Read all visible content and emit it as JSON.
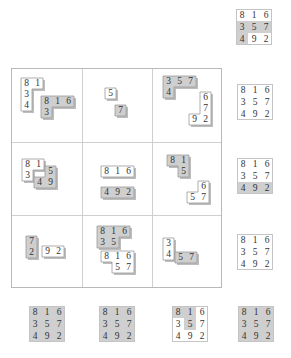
{
  "colors": {
    "shaded": "#cfcfcf",
    "light": "#ffffff",
    "border": "#9a9a9a",
    "grid": "#cfcfcf"
  },
  "magic_square": [
    [
      "8",
      "1",
      "6"
    ],
    [
      "3",
      "5",
      "7"
    ],
    [
      "4",
      "9",
      "2"
    ]
  ],
  "grid_cells": [
    {
      "name": "r1c1",
      "pieces": [
        {
          "shade": "light",
          "cells": [
            [
              "8",
              "1"
            ],
            [
              "3",
              ""
            ],
            [
              "4",
              ""
            ]
          ]
        },
        {
          "shade": "shaded",
          "cells": [
            [
              "8",
              "1",
              "6"
            ],
            [
              "3",
              "",
              ""
            ]
          ]
        }
      ]
    },
    {
      "name": "r1c2",
      "pieces": [
        {
          "shade": "light",
          "cells": [
            [
              "5"
            ]
          ]
        },
        {
          "shade": "shaded",
          "cells": [
            [
              "7"
            ]
          ]
        }
      ]
    },
    {
      "name": "r1c3",
      "pieces": [
        {
          "shade": "shaded",
          "cells": [
            [
              "3",
              "5",
              "7"
            ],
            [
              "4",
              "",
              ""
            ]
          ]
        },
        {
          "shade": "light",
          "cells": [
            [
              "",
              "6"
            ],
            [
              "",
              "7"
            ],
            [
              "9",
              "2"
            ]
          ]
        }
      ]
    },
    {
      "name": "r2c1",
      "pieces": [
        {
          "shade": "light",
          "cells": [
            [
              "8",
              "1"
            ],
            [
              "3",
              ""
            ]
          ]
        },
        {
          "shade": "shaded",
          "cells": [
            [
              "",
              "5"
            ],
            [
              "4",
              "9"
            ]
          ]
        }
      ]
    },
    {
      "name": "r2c2",
      "pieces": [
        {
          "shade": "light",
          "cells": [
            [
              "8",
              "1",
              "6"
            ]
          ]
        },
        {
          "shade": "shaded",
          "cells": [
            [
              "4",
              "9",
              "2"
            ]
          ]
        }
      ]
    },
    {
      "name": "r2c3",
      "pieces": [
        {
          "shade": "shaded",
          "cells": [
            [
              "8",
              "1"
            ],
            [
              "",
              "5"
            ]
          ]
        },
        {
          "shade": "light",
          "cells": [
            [
              "",
              "6"
            ],
            [
              "5",
              "7"
            ]
          ]
        }
      ]
    },
    {
      "name": "r3c1",
      "pieces": [
        {
          "shade": "shaded",
          "cells": [
            [
              "7"
            ],
            [
              "2"
            ]
          ]
        },
        {
          "shade": "light",
          "cells": [
            [
              "9",
              "2"
            ]
          ]
        }
      ]
    },
    {
      "name": "r3c2",
      "pieces": [
        {
          "shade": "shaded",
          "cells": [
            [
              "8",
              "1",
              "6"
            ],
            [
              "3",
              "5",
              ""
            ]
          ]
        },
        {
          "shade": "light",
          "cells": [
            [
              "8",
              "1",
              "6"
            ],
            [
              "",
              "5",
              "7"
            ]
          ]
        }
      ]
    },
    {
      "name": "r3c3",
      "pieces": [
        {
          "shade": "light",
          "cells": [
            [
              "3"
            ],
            [
              "4"
            ]
          ]
        },
        {
          "shade": "shaded",
          "cells": [
            [
              "5",
              "7"
            ]
          ]
        }
      ]
    }
  ],
  "side_squares": [
    {
      "name": "top",
      "shaded": [
        [
          0,
          0,
          0
        ],
        [
          1,
          1,
          1
        ],
        [
          1,
          0,
          0
        ]
      ]
    },
    {
      "name": "row1",
      "shaded": [
        [
          0,
          0,
          0
        ],
        [
          0,
          0,
          0
        ],
        [
          0,
          0,
          0
        ]
      ]
    },
    {
      "name": "row2",
      "shaded": [
        [
          0,
          0,
          0
        ],
        [
          0,
          0,
          0
        ],
        [
          1,
          1,
          1
        ]
      ]
    },
    {
      "name": "row3",
      "shaded": [
        [
          0,
          0,
          0
        ],
        [
          0,
          0,
          0
        ],
        [
          0,
          0,
          0
        ]
      ]
    }
  ],
  "bottom_squares": [
    {
      "name": "col1",
      "shaded": [
        [
          1,
          1,
          1
        ],
        [
          1,
          1,
          1
        ],
        [
          1,
          1,
          1
        ]
      ]
    },
    {
      "name": "col2",
      "shaded": [
        [
          1,
          1,
          1
        ],
        [
          1,
          1,
          1
        ],
        [
          1,
          1,
          1
        ]
      ]
    },
    {
      "name": "col3",
      "shaded": [
        [
          1,
          1,
          0
        ],
        [
          0,
          1,
          0
        ],
        [
          0,
          0,
          0
        ]
      ]
    },
    {
      "name": "col4",
      "shaded": [
        [
          1,
          1,
          1
        ],
        [
          1,
          1,
          1
        ],
        [
          1,
          1,
          1
        ]
      ]
    }
  ]
}
